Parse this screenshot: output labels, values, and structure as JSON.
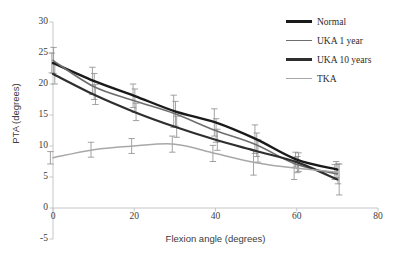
{
  "chart_data": {
    "type": "line",
    "title": "",
    "xlabel": "Flexion angle (degrees)",
    "ylabel": "PTA (degrees)",
    "x": [
      0,
      10,
      20,
      30,
      40,
      50,
      60,
      70
    ],
    "xlim": [
      0,
      80
    ],
    "ylim": [
      -5,
      30
    ],
    "xticks": [
      "0",
      "20",
      "40",
      "60",
      "80"
    ],
    "yticks": [
      "30",
      "25",
      "20",
      "15",
      "10",
      "5",
      "0",
      "-5"
    ],
    "grid": false,
    "legend_position": "top-right",
    "error_bars": "symmetric-std-dev",
    "series": [
      {
        "name": "Normal",
        "color": "#1a1a1a",
        "width": 2.4,
        "values": [
          23.4,
          20.5,
          18.1,
          15.6,
          13.8,
          11.1,
          7.8,
          6.2
        ],
        "errors": [
          1.6,
          2.2,
          1.9,
          2.6,
          2.2,
          2.3,
          1.2,
          1.3
        ]
      },
      {
        "name": "UKA 1 year",
        "color": "#6e6e6e",
        "width": 1.6,
        "values": [
          23.8,
          19.6,
          17.3,
          15.2,
          12.5,
          10.2,
          7.0,
          5.5
        ],
        "errors": [
          2.1,
          2.1,
          1.9,
          2.0,
          1.9,
          1.9,
          1.3,
          1.6
        ]
      },
      {
        "name": "UKA 10 years",
        "color": "#2e2e2e",
        "width": 2.2,
        "values": [
          21.6,
          18.3,
          15.5,
          13.1,
          11.0,
          9.2,
          7.4,
          4.6
        ],
        "errors": [
          1.6,
          1.6,
          1.4,
          1.7,
          1.7,
          1.8,
          1.5,
          2.5
        ]
      },
      {
        "name": "TKA",
        "color": "#a8a8a8",
        "width": 1.5,
        "values": [
          8.1,
          9.4,
          10.0,
          10.3,
          8.8,
          7.3,
          6.4,
          5.8
        ],
        "errors": [
          1.0,
          1.2,
          1.2,
          1.3,
          1.3,
          2.0,
          1.8,
          1.2
        ]
      }
    ]
  },
  "axes": {
    "x_title": "Flexion angle (degrees)",
    "y_title": "PTA (degrees)",
    "x_tick_labels": [
      "0",
      "20",
      "40",
      "60",
      "80"
    ],
    "y_tick_labels": [
      "30",
      "25",
      "20",
      "15",
      "10",
      "5",
      "0",
      "-5"
    ],
    "axis_color": "#bfbfbf"
  },
  "legend": {
    "items": [
      {
        "label": "Normal",
        "color": "#1a1a1a",
        "thickness": 2.6
      },
      {
        "label": "UKA 1 year",
        "color": "#6e6e6e",
        "thickness": 1.6
      },
      {
        "label": "UKA 10 years",
        "color": "#2e2e2e",
        "thickness": 2.4
      },
      {
        "label": "TKA",
        "color": "#a8a8a8",
        "thickness": 1.5
      }
    ]
  }
}
